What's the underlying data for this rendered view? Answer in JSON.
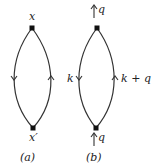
{
  "diagram_a": {
    "top_vertex_label": "x",
    "bottom_vertex_label": "x′",
    "caption": "(a)"
  },
  "diagram_b": {
    "top_momentum_label": "q",
    "bottom_momentum_label": "q",
    "left_line_label": "k",
    "right_line_label": "k + q",
    "caption": "(b)"
  }
}
